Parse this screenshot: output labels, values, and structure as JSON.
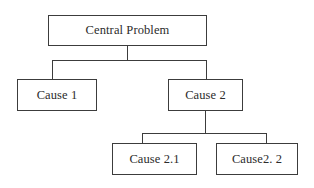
{
  "diagram": {
    "type": "hierarchy-tree",
    "orientation": "top-down",
    "background_color": "#ffffff",
    "line_color": "#3c3c3c",
    "text_color": "#2b2b2b",
    "nodes": {
      "root": {
        "label": "Central Problem"
      },
      "level2": [
        {
          "label": "Cause 1"
        },
        {
          "label": "Cause 2"
        }
      ],
      "level3": [
        {
          "label": "Cause 2.1"
        },
        {
          "label": "Cause2. 2"
        }
      ]
    }
  }
}
